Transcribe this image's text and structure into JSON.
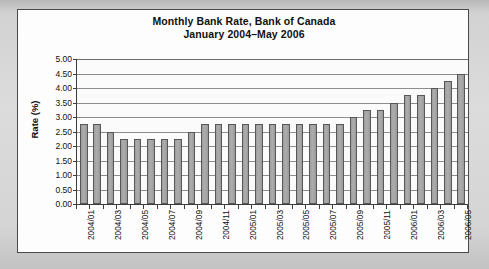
{
  "chart_data": {
    "type": "bar",
    "title": "Monthly Bank Rate, Bank of Canada",
    "subtitle": "January 2004–May 2006",
    "xlabel": "",
    "ylabel": "Rate (%)",
    "ylim": [
      0.0,
      5.0
    ],
    "ytick_step": 0.5,
    "ytick_labels": [
      "5.00",
      "4.50",
      "4.00",
      "3.50",
      "3.00",
      "2.50",
      "2.00",
      "1.50",
      "1.00",
      "0.50",
      "0.00"
    ],
    "ytick_values": [
      5.0,
      4.5,
      4.0,
      3.5,
      3.0,
      2.5,
      2.0,
      1.5,
      1.0,
      0.5,
      0.0
    ],
    "grid": true,
    "legend": false,
    "bar_color": "#a8a8a8",
    "bar_border_color": "#575757",
    "plot_background": "#fbfbfb",
    "categories": [
      "2004/01",
      "2004/02",
      "2004/03",
      "2004/04",
      "2004/05",
      "2004/06",
      "2004/07",
      "2004/08",
      "2004/09",
      "2004/10",
      "2004/11",
      "2004/12",
      "2005/01",
      "2005/02",
      "2005/03",
      "2005/04",
      "2005/05",
      "2005/06",
      "2005/07",
      "2005/08",
      "2005/09",
      "2005/10",
      "2005/11",
      "2005/12",
      "2006/01",
      "2006/02",
      "2006/03",
      "2006/04",
      "2006/05"
    ],
    "values": [
      2.75,
      2.75,
      2.5,
      2.25,
      2.25,
      2.25,
      2.25,
      2.25,
      2.5,
      2.75,
      2.75,
      2.75,
      2.75,
      2.75,
      2.75,
      2.75,
      2.75,
      2.75,
      2.75,
      2.75,
      3.0,
      3.25,
      3.25,
      3.5,
      3.75,
      3.75,
      4.0,
      4.25,
      4.5
    ],
    "visible_xtick_labels": [
      "2004/01",
      "2004/03",
      "2004/05",
      "2004/07",
      "2004/09",
      "2004/11",
      "2005/01",
      "2005/03",
      "2005/05",
      "2005/07",
      "2005/09",
      "2005/11",
      "2006/01",
      "2006/03",
      "2006/05"
    ],
    "visible_xtick_indices": [
      0,
      2,
      4,
      6,
      8,
      10,
      12,
      14,
      16,
      18,
      20,
      22,
      24,
      26,
      28
    ]
  }
}
